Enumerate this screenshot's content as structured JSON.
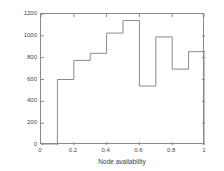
{
  "chart_data": {
    "type": "bar",
    "style": "step-histogram",
    "title": "",
    "xlabel": "Node availability",
    "ylabel": "Number of incoming VS references",
    "xlim": [
      0,
      1
    ],
    "ylim": [
      0,
      1200
    ],
    "grid": false,
    "legend": null,
    "xticks": [
      "0",
      "0.2",
      "0.4",
      "0.6",
      "0.8",
      "1"
    ],
    "xtick_values": [
      0,
      0.2,
      0.4,
      0.6,
      0.8,
      1
    ],
    "yticks": [
      "0",
      "200",
      "400",
      "600",
      "800",
      "1000",
      "1200"
    ],
    "ytick_values": [
      0,
      200,
      400,
      600,
      800,
      1000,
      1200
    ],
    "bin_width": 0.1,
    "bin_edges": [
      0,
      0.1,
      0.2,
      0.3,
      0.4,
      0.5,
      0.6,
      0.7,
      0.8,
      0.9,
      1.0
    ],
    "categories": [
      "0.0-0.1",
      "0.1-0.2",
      "0.2-0.3",
      "0.3-0.4",
      "0.4-0.5",
      "0.5-0.6",
      "0.6-0.7",
      "0.7-0.8",
      "0.8-0.9",
      "0.9-1.0"
    ],
    "values": [
      0,
      600,
      775,
      840,
      1025,
      1140,
      540,
      990,
      695,
      855
    ],
    "line_color": "#8a8a8a",
    "background_color": "#ffffff",
    "tick_direction": "in"
  }
}
